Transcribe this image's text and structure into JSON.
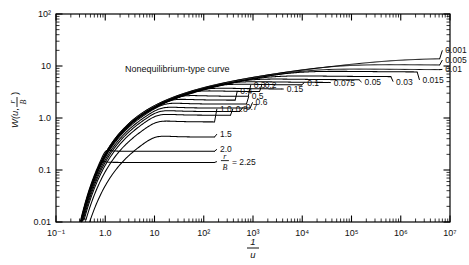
{
  "figure": {
    "annotation": "Nonequilibrium-type curve",
    "background_color": "#ffffff",
    "line_color": "#000000"
  },
  "axes": {
    "x": {
      "title_numerator": "1",
      "title_denominator": "u",
      "tick_labels": [
        "10⁻¹",
        "1.0",
        "10",
        "10²",
        "10³",
        "10⁴",
        "10⁵",
        "10⁶",
        "10⁷"
      ],
      "tick_values": [
        0.1,
        1,
        10,
        100,
        1000,
        10000,
        100000,
        1000000,
        10000000
      ],
      "min": 0.1,
      "max": 10000000,
      "scale": "log"
    },
    "y": {
      "title": "W(u, r/B)",
      "title_main": "W(u,",
      "title_frac_num": "r",
      "title_frac_den": "B",
      "title_close": ")",
      "tick_labels": [
        "10²",
        "10",
        "1.0",
        "0.1",
        "0.01"
      ],
      "tick_values": [
        100,
        10,
        1,
        0.1,
        0.01
      ],
      "min": 0.01,
      "max": 100,
      "scale": "log"
    }
  },
  "chart_data": {
    "type": "line",
    "title": "",
    "subtitle": "",
    "xlabel": "1/u",
    "ylabel": "W(u, r/B)",
    "xscale": "log",
    "yscale": "log",
    "xlim": [
      0.1,
      10000000
    ],
    "ylim": [
      0.01,
      100
    ],
    "grid": false,
    "legend": "inline curve labels",
    "annotations": [
      "Nonequilibrium-type curve"
    ],
    "series_parameter_name": "r/B",
    "series": [
      {
        "name": "0.001",
        "rB": 0.001,
        "plateau": 13.4,
        "label_x": 7000000,
        "label_y": 20.0
      },
      {
        "name": "0.005",
        "rB": 0.005,
        "plateau": 10.2,
        "label_x": 7000000,
        "label_y": 13.0
      },
      {
        "name": "0.01",
        "rB": 0.01,
        "plateau": 8.4,
        "label_x": 7000000,
        "label_y": 8.6
      },
      {
        "name": "0.015",
        "rB": 0.015,
        "plateau": 7.6,
        "label_x": 2400000,
        "label_y": 5.4
      },
      {
        "name": "0.03",
        "rB": 0.03,
        "plateau": 6.2,
        "label_x": 700000,
        "label_y": 5.0
      },
      {
        "name": "0.05",
        "rB": 0.05,
        "plateau": 5.4,
        "label_x": 160000,
        "label_y": 4.9
      },
      {
        "name": "0.075",
        "rB": 0.075,
        "plateau": 4.8,
        "label_x": 38000,
        "label_y": 4.8
      },
      {
        "name": "0.1",
        "rB": 0.1,
        "plateau": 4.3,
        "label_x": 11000,
        "label_y": 4.8
      },
      {
        "name": "0.15",
        "rB": 0.15,
        "plateau": 3.6,
        "label_x": 4200,
        "label_y": 3.6
      },
      {
        "name": "0.2",
        "rB": 0.2,
        "plateau": 3.2,
        "label_x": 1500,
        "label_y": 4.3
      },
      {
        "name": "0.3",
        "rB": 0.3,
        "plateau": 2.6,
        "label_x": 900,
        "label_y": 4.3
      },
      {
        "name": "0.4",
        "rB": 0.4,
        "plateau": 2.2,
        "label_x": 480,
        "label_y": 3.3
      },
      {
        "name": "0.5",
        "rB": 0.5,
        "plateau": 1.85,
        "label_x": 820,
        "label_y": 2.6
      },
      {
        "name": "0.6",
        "rB": 0.6,
        "plateau": 1.55,
        "label_x": 980,
        "label_y": 2.0
      },
      {
        "name": "0.7",
        "rB": 0.7,
        "plateau": 1.33,
        "label_x": 620,
        "label_y": 1.6
      },
      {
        "name": "0.8",
        "rB": 0.8,
        "plateau": 1.13,
        "label_x": 390,
        "label_y": 1.5
      },
      {
        "name": "1.0",
        "rB": 1.0,
        "plateau": 0.84,
        "label_x": 185,
        "label_y": 1.5
      },
      {
        "name": "1.5",
        "rB": 1.5,
        "plateau": 0.43,
        "label_x": 185,
        "label_y": 0.49
      },
      {
        "name": "2.0",
        "rB": 2.0,
        "plateau": 0.23,
        "label_x": 185,
        "label_y": 0.25
      },
      {
        "name": "2.25",
        "rB": 2.25,
        "plateau": 0.14,
        "label_x": 185,
        "label_y": 0.145,
        "label_prefix": "r/B =",
        "label_text": "= 2.25"
      }
    ]
  },
  "curve_labels": [
    "0.001",
    "0.005",
    "0.01",
    "0.015",
    "0.03",
    "0.05",
    "0.075",
    "0.1",
    "0.15",
    "0.2",
    "0.3",
    "0.4",
    "0.5",
    "0.6",
    "0.7",
    "0.8",
    "1.0",
    "1.5",
    "2.0",
    "2.25"
  ]
}
